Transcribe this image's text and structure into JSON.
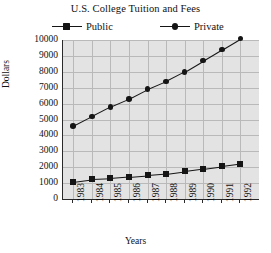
{
  "chart_data": {
    "type": "line",
    "title": "U.S. College Tuition and Fees",
    "xlabel": "Years",
    "ylabel": "Dollars",
    "categories": [
      "1983",
      "1984",
      "1985",
      "1986",
      "1987",
      "1988",
      "1989",
      "1990",
      "1991",
      "1992"
    ],
    "yticks": [
      "0",
      "1000",
      "2000",
      "3000",
      "4000",
      "5000",
      "6000",
      "7000",
      "8000",
      "9000",
      "10000"
    ],
    "ylim": [
      0,
      10000
    ],
    "grid": true,
    "legend_position": "top",
    "series": [
      {
        "name": "Public",
        "marker": "square",
        "color": "#151515",
        "values": [
          1100,
          1250,
          1300,
          1400,
          1500,
          1600,
          1750,
          1900,
          2050,
          2200
        ]
      },
      {
        "name": "Private",
        "marker": "circle",
        "color": "#151515",
        "values": [
          4600,
          5200,
          5800,
          6300,
          6900,
          7400,
          8000,
          8700,
          9400,
          10100
        ]
      }
    ]
  },
  "legend": {
    "public_label": "Public",
    "private_label": "Private"
  }
}
